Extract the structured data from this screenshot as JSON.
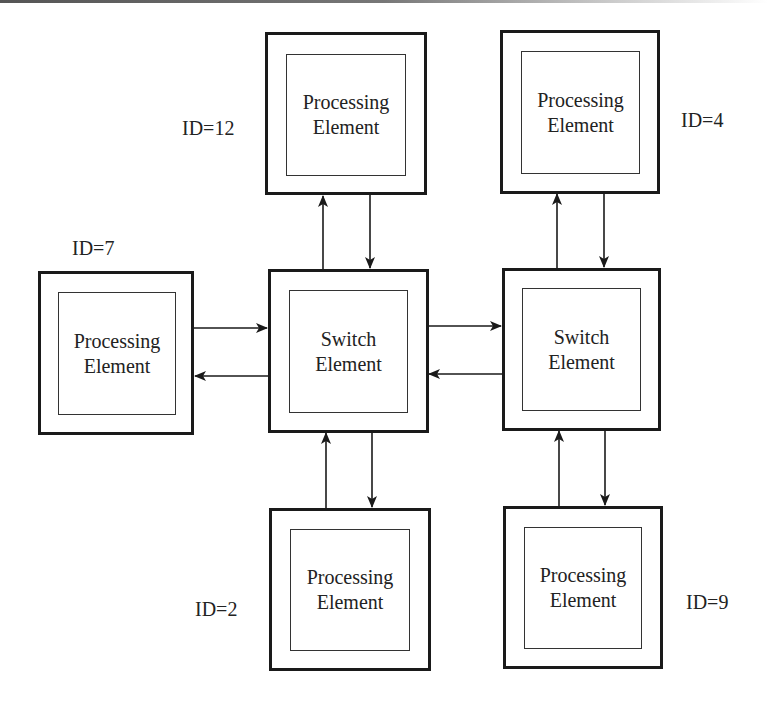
{
  "diagram": {
    "type": "network-on-chip mesh",
    "colors": {
      "stroke": "#1a1a1a",
      "text": "#222222",
      "background": "#ffffff"
    },
    "nodes": [
      {
        "id": "pe12",
        "kind": "processing",
        "line1": "Processing",
        "line2": "Element",
        "id_label": "ID=12"
      },
      {
        "id": "pe4",
        "kind": "processing",
        "line1": "Processing",
        "line2": "Element",
        "id_label": "ID=4"
      },
      {
        "id": "pe7",
        "kind": "processing",
        "line1": "Processing",
        "line2": "Element",
        "id_label": "ID=7"
      },
      {
        "id": "sw1",
        "kind": "switch",
        "line1": "Switch",
        "line2": "Element"
      },
      {
        "id": "sw2",
        "kind": "switch",
        "line1": "Switch",
        "line2": "Element"
      },
      {
        "id": "pe2",
        "kind": "processing",
        "line1": "Processing",
        "line2": "Element",
        "id_label": "ID=2"
      },
      {
        "id": "pe9",
        "kind": "processing",
        "line1": "Processing",
        "line2": "Element",
        "id_label": "ID=9"
      }
    ],
    "edges": [
      {
        "from": "sw1",
        "to": "pe12"
      },
      {
        "from": "pe12",
        "to": "sw1"
      },
      {
        "from": "sw2",
        "to": "pe4"
      },
      {
        "from": "pe4",
        "to": "sw2"
      },
      {
        "from": "pe7",
        "to": "sw1"
      },
      {
        "from": "sw1",
        "to": "pe7"
      },
      {
        "from": "sw1",
        "to": "sw2"
      },
      {
        "from": "sw2",
        "to": "sw1"
      },
      {
        "from": "pe2",
        "to": "sw1"
      },
      {
        "from": "sw1",
        "to": "pe2"
      },
      {
        "from": "pe9",
        "to": "sw2"
      },
      {
        "from": "sw2",
        "to": "pe9"
      }
    ]
  }
}
